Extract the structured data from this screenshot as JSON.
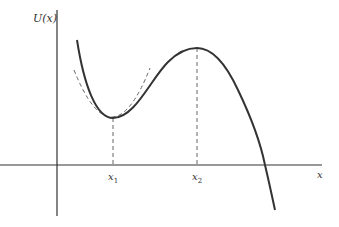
{
  "diagram": {
    "y_axis_label": "U(x)",
    "x_axis_label": "x",
    "points": [
      {
        "label": "x",
        "subscript": "1",
        "meaning": "local minimum (stable equilibrium)"
      },
      {
        "label": "x",
        "subscript": "2",
        "meaning": "local maximum (unstable equilibrium)"
      }
    ],
    "annotations": {
      "tangent_parabola": "dashed parabolic approximation near minimum x1"
    },
    "colors": {
      "curve": "#333333",
      "axes": "#333333",
      "dashed": "#666666"
    }
  }
}
